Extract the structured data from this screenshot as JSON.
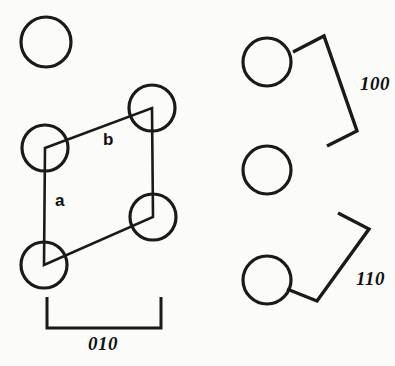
{
  "figure": {
    "type": "crystal-lattice-diagram",
    "background_color": "#fbfbf9",
    "ink_color": "#1a1a1a"
  },
  "lattice": {
    "vectors": [
      {
        "id": "a",
        "label": "a",
        "x": 55,
        "y": 206,
        "orientation": "vertical-left-edge"
      },
      {
        "id": "b",
        "label": "b",
        "x": 103,
        "y": 145,
        "orientation": "diagonal-top-edge"
      }
    ],
    "cell_atoms": [
      {
        "id": "atom-cell-top-right",
        "cx": 152,
        "cy": 108,
        "r": 23
      },
      {
        "id": "atom-cell-top-left",
        "cx": 45,
        "cy": 148,
        "r": 23
      },
      {
        "id": "atom-cell-bottom-right",
        "cx": 153,
        "cy": 217,
        "r": 23
      },
      {
        "id": "atom-cell-bottom-left",
        "cx": 44,
        "cy": 265,
        "r": 23
      }
    ],
    "free_atoms": [
      {
        "id": "atom-free-top-left",
        "cx": 46,
        "cy": 42,
        "r": 25
      }
    ],
    "cell_outline_points": "45,148 152,108 153,217 44,265"
  },
  "dimension": {
    "id": "dim-010",
    "label": "010",
    "label_x": 103,
    "label_y": 350,
    "bracket": {
      "x1": 47,
      "x2": 161,
      "y_line": 328,
      "tick_top": 297
    }
  },
  "planes": [
    {
      "id": "plane-100",
      "label": "100",
      "label_x": 360,
      "label_y": 90,
      "atoms": [
        {
          "id": "atom-100-upper",
          "cx": 267,
          "cy": 62,
          "r": 24
        },
        {
          "id": "atom-100-lower",
          "cx": 267,
          "cy": 170,
          "r": 24
        }
      ],
      "bracket_path": "M293,52 L324,36 L357,131 L327,146"
    },
    {
      "id": "plane-110",
      "label": "110",
      "label_x": 356,
      "label_y": 285,
      "atoms": [
        {
          "id": "atom-110-upper",
          "cx": 267,
          "cy": 170,
          "r": 24
        },
        {
          "id": "atom-110-lower",
          "cx": 267,
          "cy": 280,
          "r": 24
        }
      ],
      "bracket_path": "M338,213 L369,229 L317,301 L287,289"
    }
  ]
}
